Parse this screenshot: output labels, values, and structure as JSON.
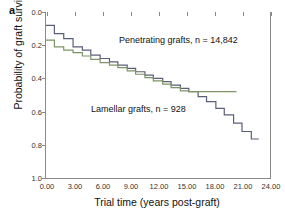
{
  "panel": {
    "label": "a"
  },
  "axes": {
    "ylabel": "Probability of graft survival",
    "xlabel": "Trial time (years post-graft)",
    "yticks": [
      "1.0",
      "0.8",
      "0.6",
      "0.4",
      "0.2",
      "0.0"
    ],
    "xticks": [
      "0.00",
      "3.00",
      "6.00",
      "9.00",
      "12.00",
      "15.00",
      "18.00",
      "21.00",
      "24.00"
    ]
  },
  "annotations": {
    "penetrating": "Penetrating grafts, n = 14,842",
    "lamellar": "Lamellar grafts, n = 928"
  },
  "colors": {
    "penetrating": "#5a5f7a",
    "lamellar": "#7f9466",
    "axis": "#8a8a8a",
    "text": "#111111",
    "background": "#ffffff"
  },
  "chart_data": {
    "type": "line",
    "subtype": "kaplan-meier-step",
    "title": "",
    "xlabel": "Trial time (years post-graft)",
    "ylabel": "Probability of graft survival",
    "xlim": [
      0,
      24
    ],
    "ylim": [
      0.0,
      1.0
    ],
    "xticks": [
      0,
      3,
      6,
      9,
      12,
      15,
      18,
      21,
      24
    ],
    "yticks": [
      0.0,
      0.2,
      0.4,
      0.6,
      0.8,
      1.0
    ],
    "grid": false,
    "legend": "inline-annotations",
    "series": [
      {
        "name": "Penetrating grafts",
        "n": 14842,
        "color": "#5a5f7a",
        "annotation": "Penetrating grafts, n = 14,842",
        "x": [
          0.0,
          0.9,
          1.9,
          2.9,
          3.9,
          4.8,
          5.8,
          6.8,
          7.7,
          8.7,
          9.6,
          10.6,
          11.5,
          12.5,
          13.4,
          14.4,
          15.3,
          16.3,
          17.2,
          18.2,
          19.1,
          20.1,
          21.0,
          22.0,
          22.8
        ],
        "y": [
          0.92,
          0.87,
          0.84,
          0.79,
          0.77,
          0.74,
          0.72,
          0.7,
          0.68,
          0.66,
          0.64,
          0.62,
          0.6,
          0.58,
          0.56,
          0.54,
          0.52,
          0.49,
          0.46,
          0.42,
          0.38,
          0.33,
          0.28,
          0.235,
          0.235
        ]
      },
      {
        "name": "Lamellar grafts",
        "n": 928,
        "color": "#7f9466",
        "annotation": "Lamellar grafts, n = 928",
        "x": [
          0.0,
          0.9,
          1.9,
          2.9,
          3.9,
          4.8,
          5.8,
          6.8,
          7.7,
          8.7,
          9.6,
          10.6,
          11.5,
          12.5,
          13.4,
          14.4,
          15.3,
          20.4
        ],
        "y": [
          0.83,
          0.79,
          0.77,
          0.755,
          0.735,
          0.715,
          0.695,
          0.68,
          0.665,
          0.645,
          0.625,
          0.605,
          0.585,
          0.565,
          0.545,
          0.525,
          0.52,
          0.52
        ]
      }
    ]
  }
}
